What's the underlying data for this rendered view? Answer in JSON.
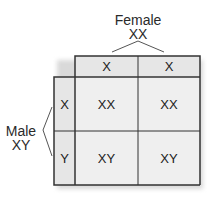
{
  "diagram": {
    "type": "punnett-square",
    "female": {
      "label": "Female",
      "genotype": "XX",
      "gametes": [
        "X",
        "X"
      ]
    },
    "male": {
      "label": "Male",
      "genotype": "XY",
      "gametes": [
        "X",
        "Y"
      ]
    },
    "offspring": [
      [
        "XX",
        "XX"
      ],
      [
        "XY",
        "XY"
      ]
    ]
  },
  "colors": {
    "header_fill": "#e6e6e6",
    "cell_fill": "#efefef",
    "border": "#333333"
  }
}
